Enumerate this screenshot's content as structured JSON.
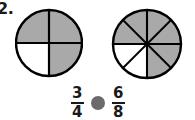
{
  "item": {
    "number_label": "2.",
    "type": "compare-fractions"
  },
  "models": [
    {
      "name": "circle-quarters",
      "total_parts": 4,
      "shaded_parts": 3,
      "shaded_sectors": [
        0,
        1,
        3
      ],
      "fill_color": "#a9a9a9",
      "empty_color": "#ffffff",
      "stroke_color": "#000000",
      "radius": 33
    },
    {
      "name": "circle-eighths",
      "total_parts": 8,
      "shaded_parts": 6,
      "shaded_sectors": [
        0,
        1,
        2,
        3,
        6,
        7
      ],
      "fill_color": "#a9a9a9",
      "empty_color": "#ffffff",
      "stroke_color": "#000000",
      "radius": 34
    }
  ],
  "comparison": {
    "left_fraction": {
      "numerator": "3",
      "denominator": "4"
    },
    "right_fraction": {
      "numerator": "6",
      "denominator": "8"
    },
    "operator_symbol": "",
    "bubble_color": "#6b6b6b"
  }
}
